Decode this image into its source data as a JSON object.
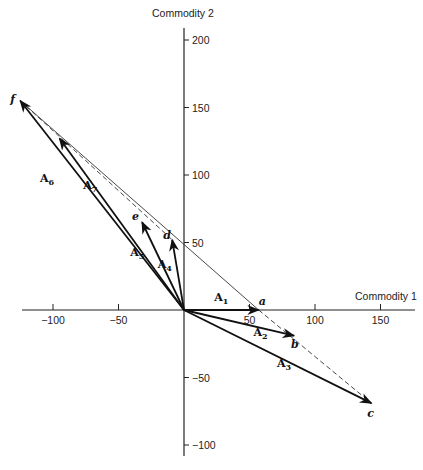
{
  "figure": {
    "x_axis_label": "Commodity 1",
    "y_axis_label": "Commodity 2",
    "x_ticks": [
      -100,
      -50,
      50,
      100,
      150
    ],
    "y_ticks": [
      200,
      150,
      100,
      50,
      -50,
      -100
    ],
    "origin_px": [
      184,
      310
    ],
    "scale_px_per_unit": [
      1.31,
      1.35
    ]
  },
  "chart_data": {
    "type": "vector-diagram",
    "xlabel": "Commodity 1",
    "ylabel": "Commodity 2",
    "xlim": [
      -125,
      165
    ],
    "ylim": [
      -110,
      205
    ],
    "x_ticks": [
      -100,
      -50,
      50,
      100,
      150
    ],
    "y_ticks": [
      -100,
      -50,
      50,
      100,
      150,
      200
    ],
    "points": [
      {
        "name": "a",
        "x": 57,
        "y": 0
      },
      {
        "name": "b",
        "x": 84,
        "y": -19
      },
      {
        "name": "c",
        "x": 143,
        "y": -69
      },
      {
        "name": "d",
        "x": -9,
        "y": 52
      },
      {
        "name": "e",
        "x": -32,
        "y": 65
      },
      {
        "name": "f",
        "x": -125,
        "y": 155
      }
    ],
    "vectors": [
      {
        "name": "A1",
        "label": "A",
        "sub": "1",
        "from": [
          0,
          0
        ],
        "to": [
          57,
          0
        ],
        "label_pos": [
          23,
          7
        ]
      },
      {
        "name": "A2",
        "label": "A",
        "sub": "2",
        "from": [
          0,
          0
        ],
        "to": [
          84,
          -19
        ],
        "label_pos": [
          53,
          -19
        ]
      },
      {
        "name": "A3",
        "label": "A",
        "sub": "3",
        "from": [
          0,
          0
        ],
        "to": [
          143,
          -69
        ],
        "label_pos": [
          71,
          -42
        ]
      },
      {
        "name": "A4",
        "label": "A",
        "sub": "4",
        "from": [
          0,
          0
        ],
        "to": [
          -9,
          52
        ],
        "label_pos": [
          -20,
          31
        ]
      },
      {
        "name": "A5",
        "label": "A",
        "sub": "5",
        "from": [
          0,
          0
        ],
        "to": [
          -32,
          65
        ],
        "label_pos": [
          -41,
          40
        ]
      },
      {
        "name": "A6",
        "label": "A",
        "sub": "6",
        "from": [
          0,
          0
        ],
        "to": [
          -125,
          155
        ],
        "label_pos": [
          -110,
          95
        ]
      },
      {
        "name": "A7",
        "label": "A",
        "sub": "7",
        "from": [
          0,
          0
        ],
        "to": [
          -95,
          127
        ],
        "label_pos": [
          -77,
          90
        ]
      }
    ],
    "lines": [
      {
        "name": "f-to-a-solid",
        "style": "solid",
        "from": [
          -125,
          155
        ],
        "to": [
          57,
          0
        ]
      },
      {
        "name": "f-to-d-dashed",
        "style": "dashed",
        "from": [
          -125,
          155
        ],
        "to": [
          -9,
          52
        ]
      },
      {
        "name": "a-to-c-dashed",
        "style": "dashed",
        "from": [
          57,
          0
        ],
        "to": [
          143,
          -69
        ]
      }
    ]
  }
}
